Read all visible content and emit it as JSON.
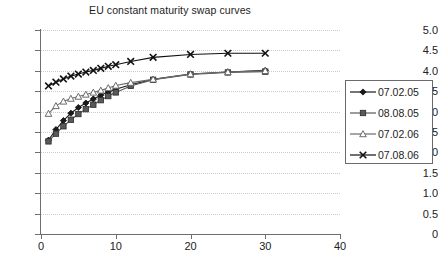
{
  "chart_data": {
    "type": "line",
    "title": "EU constant maturity swap curves",
    "xlabel": "",
    "ylabel": "",
    "xlim": [
      0,
      40
    ],
    "ylim": [
      0,
      5.0
    ],
    "xticks": [
      "0",
      "10",
      "20",
      "30",
      "40"
    ],
    "xtick_values": [
      0,
      10,
      20,
      30,
      40
    ],
    "yticks": [
      "0",
      "0.5",
      "1.0",
      "1.5",
      "2.0",
      "2.5",
      "3.0",
      "3.5",
      "4.0",
      "4.5",
      "5.0"
    ],
    "ytick_values": [
      0,
      0.5,
      1.0,
      1.5,
      2.0,
      2.5,
      3.0,
      3.5,
      4.0,
      4.5,
      5.0
    ],
    "grid": "horizontal-dotted",
    "legend_position": "right",
    "x": [
      1,
      2,
      3,
      4,
      5,
      6,
      7,
      8,
      9,
      10,
      12,
      15,
      20,
      25,
      30
    ],
    "series": [
      {
        "name": "07.02.05",
        "marker": "diamond",
        "color": "#1a1a1a",
        "values": [
          2.3,
          2.56,
          2.78,
          2.96,
          3.1,
          3.21,
          3.31,
          3.4,
          3.48,
          3.55,
          3.66,
          3.79,
          3.92,
          3.97,
          4.01
        ]
      },
      {
        "name": "08.08.05",
        "marker": "square",
        "color": "#595959",
        "values": [
          2.27,
          2.46,
          2.64,
          2.8,
          2.94,
          3.06,
          3.17,
          3.28,
          3.38,
          3.47,
          3.63,
          3.78,
          3.91,
          3.96,
          3.98
        ]
      },
      {
        "name": "07.02.06",
        "marker": "triangle-open",
        "color": "#6b6b6b",
        "values": [
          2.95,
          3.14,
          3.25,
          3.32,
          3.37,
          3.42,
          3.47,
          3.52,
          3.58,
          3.64,
          3.71,
          3.79,
          3.92,
          3.97,
          4.0
        ]
      },
      {
        "name": "07.08.06",
        "marker": "cross",
        "color": "#111111",
        "values": [
          3.63,
          3.72,
          3.8,
          3.87,
          3.92,
          3.97,
          4.01,
          4.06,
          4.11,
          4.15,
          4.23,
          4.33,
          4.4,
          4.43,
          4.43
        ]
      }
    ]
  },
  "legend": {
    "items": [
      {
        "label": "07.02.05"
      },
      {
        "label": "08.08.05"
      },
      {
        "label": "07.02.06"
      },
      {
        "label": "07.08.06"
      }
    ]
  }
}
